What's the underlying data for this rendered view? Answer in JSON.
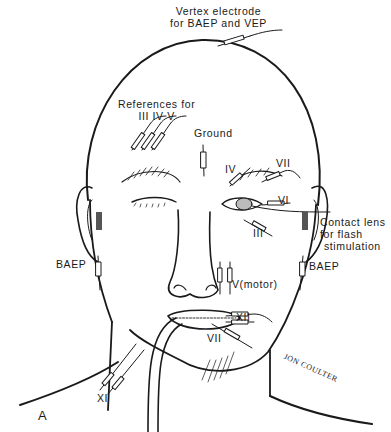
{
  "figure": {
    "panel_label": "A",
    "signature": "JON COULTER",
    "labels": {
      "vertex": [
        "Vertex electrode",
        "for BAEP and VEP"
      ],
      "references": [
        "References for",
        "III  IV V"
      ],
      "ground": "Ground",
      "iv_eye": "IV",
      "vii_eye": "VII",
      "vi_eye": "VI",
      "iii_eye": "III",
      "contact_lens": [
        "Contact lens",
        "for flash",
        "stimulation"
      ],
      "baep_left": "BAEP",
      "baep_right": "BAEP",
      "v_motor": "V(motor)",
      "xii": "XII",
      "vii_chin": "VII",
      "xi": "XI"
    },
    "colors": {
      "ink": "#1a1a1a",
      "background": "#ffffff"
    }
  }
}
